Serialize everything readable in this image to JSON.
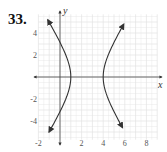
{
  "problem": {
    "number": "33."
  },
  "chart_data": {
    "type": "line",
    "title": "",
    "xlabel": "x",
    "ylabel": "y",
    "xlim": [
      -2,
      9
    ],
    "ylim": [
      -5.7,
      5.7
    ],
    "grid": true,
    "grid_step": 0.5,
    "x_ticks": [
      -2,
      2,
      4,
      6,
      8
    ],
    "x_tick_labels": [
      "-2",
      "2",
      "4",
      "6",
      "8"
    ],
    "y_ticks": [
      -4,
      -2,
      2,
      4
    ],
    "y_tick_labels": [
      "-4",
      "-2",
      "2",
      "4"
    ],
    "center": [
      2.5,
      0
    ],
    "a": 1.5,
    "b": 2.36,
    "series": [
      {
        "name": "left branch",
        "vertex": [
          1,
          0
        ],
        "endpoints": [
          [
            -0.8,
            5.2
          ],
          [
            -0.6,
            -5.0
          ]
        ]
      },
      {
        "name": "right branch",
        "vertex": [
          4,
          0
        ],
        "endpoints": [
          [
            5.9,
            4.8
          ],
          [
            5.8,
            -4.6
          ]
        ]
      }
    ],
    "colors": {
      "curve": "#333333",
      "axis": "#444444",
      "grid": "#e3e3e3"
    }
  }
}
